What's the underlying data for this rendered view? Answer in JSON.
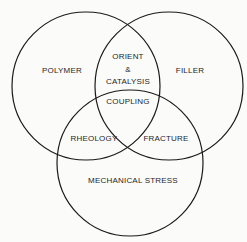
{
  "diagram": {
    "type": "venn",
    "sets": [
      {
        "id": "polymer",
        "label": "POLYMER",
        "cx": 86,
        "cy": 86,
        "r": 74
      },
      {
        "id": "filler",
        "label": "FILLER",
        "cx": 169,
        "cy": 86,
        "r": 74
      },
      {
        "id": "mechanical_stress",
        "label": "MECHANICAL STRESS",
        "cx": 130,
        "cy": 163,
        "r": 73
      }
    ],
    "intersections": {
      "polymer_filler": {
        "line1": "ORIENT",
        "line2": "&",
        "line3": "CATALYSIS"
      },
      "all_three": "COUPLING",
      "polymer_stress": "RHEOLOGY",
      "filler_stress": "FRACTURE"
    },
    "stroke_color": "#1a1a1a",
    "background": "#fbfbfa"
  }
}
